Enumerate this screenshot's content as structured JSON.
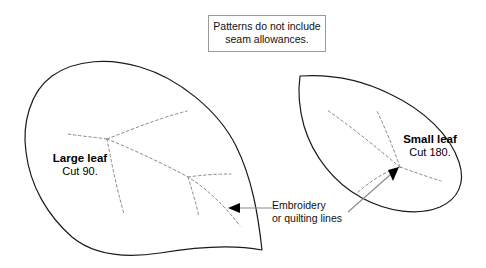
{
  "figure": {
    "title_note": {
      "lines": [
        "Patterns do not include",
        "seam allowances."
      ]
    },
    "large_leaf": {
      "name": "Large leaf",
      "cut": "Cut 90."
    },
    "small_leaf": {
      "name": "Small leaf",
      "cut": "Cut 180."
    },
    "callout": {
      "lines": [
        "Embroidery",
        "or quilting lines"
      ]
    },
    "colors": {
      "outline": "#1a1a1a",
      "dashed": "#808080",
      "leader": "#808080",
      "box_border": "#9a9a9a",
      "text": "#111111",
      "background": "#ffffff"
    }
  }
}
